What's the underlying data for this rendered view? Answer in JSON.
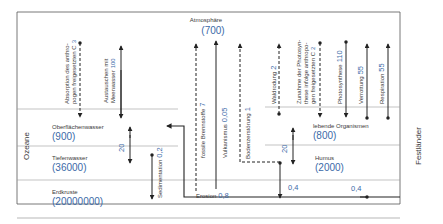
{
  "diagram": {
    "colors": {
      "text": "#3a3a3a",
      "value": "#3b6aa8",
      "line": "#222222",
      "divider": "#9a9a9a"
    },
    "regions": {
      "left": "Ozeane",
      "right": "Festländer"
    },
    "reservoirs": [
      {
        "id": "atmosphaere",
        "name": "Atmosphäre",
        "value": "(700)"
      },
      {
        "id": "oberflaechenwasser",
        "name": "Oberflächenwasser",
        "value": "(900)"
      },
      {
        "id": "tiefenwasser",
        "name": "Tiefenwasser",
        "value": "(36000)"
      },
      {
        "id": "erdkruste",
        "name": "Erdkruste",
        "value": "(20000000)"
      },
      {
        "id": "lebende-organismen",
        "name": "lebende Organismen",
        "value": "(800)"
      },
      {
        "id": "humus",
        "name": "Humus",
        "value": "(2000)"
      }
    ],
    "flows": [
      {
        "id": "absorption",
        "label_lines": [
          "Absorption des anthro-",
          "pogen freigesetzten C"
        ],
        "value": "3",
        "style": "dashed",
        "direction": "down"
      },
      {
        "id": "austausch",
        "label_lines": [
          "Austauschen mit",
          "Meerwasser"
        ],
        "value": "100",
        "style": "solid",
        "direction": "both"
      },
      {
        "id": "ozean-tiefen",
        "label_lines": [],
        "value": "20",
        "style": "solid",
        "direction": "both"
      },
      {
        "id": "sedimentation",
        "label_lines": [
          "Sedimentation"
        ],
        "value": "0,2",
        "style": "solid",
        "direction": "down"
      },
      {
        "id": "fossile",
        "label_lines": [
          "fossile Brennstoffe"
        ],
        "value": "7",
        "style": "dashed",
        "direction": "up"
      },
      {
        "id": "vulkanismus",
        "label_lines": [
          "Vulkanismus"
        ],
        "value": "0,05",
        "style": "solid",
        "direction": "up"
      },
      {
        "id": "bodenzerstoerung",
        "label_lines": [
          "Bodenzerstörung"
        ],
        "value": "1",
        "style": "dashed",
        "direction": "up"
      },
      {
        "id": "waldrodung",
        "label_lines": [
          "Waldrodung"
        ],
        "value": "2",
        "style": "dashed",
        "direction": "up"
      },
      {
        "id": "zunahme-photosynthese",
        "label_lines": [
          "Zunahme der Photosyn-",
          "these infolge anthropo-",
          "gen freigesetzten C"
        ],
        "value": "2",
        "style": "dashed",
        "direction": "down"
      },
      {
        "id": "photosynthese",
        "label_lines": [
          "Photosynthese"
        ],
        "value": "110",
        "style": "solid",
        "direction": "down"
      },
      {
        "id": "verrottung",
        "label_lines": [
          "Verrottung"
        ],
        "value": "55",
        "style": "solid",
        "direction": "up"
      },
      {
        "id": "respiration",
        "label_lines": [
          "Respiration"
        ],
        "value": "55",
        "style": "solid",
        "direction": "up"
      },
      {
        "id": "land-humus",
        "label_lines": [],
        "value": "20",
        "style": "solid",
        "direction": "both"
      },
      {
        "id": "erosion",
        "label_lines": [
          "Erosion"
        ],
        "value": "0,8",
        "style": "solid",
        "direction": "left"
      },
      {
        "id": "humus-kruste",
        "label_lines": [],
        "value": "0,4",
        "style": "solid",
        "direction": "down"
      },
      {
        "id": "kruste-land",
        "label_lines": [],
        "value": "0,4",
        "style": "solid",
        "direction": "right"
      }
    ]
  }
}
